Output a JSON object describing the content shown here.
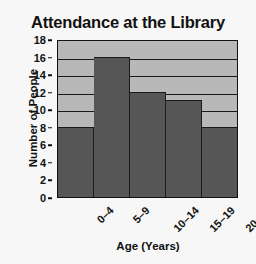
{
  "chart_data": {
    "type": "bar",
    "title": "Attendance at the Library",
    "xlabel": "Age (Years)",
    "ylabel": "Number of People",
    "categories": [
      "0–4",
      "5–9",
      "10–14",
      "15–19",
      "20–24"
    ],
    "values": [
      8,
      16,
      12,
      11,
      8
    ],
    "ylim": [
      0,
      18
    ],
    "ytick_values": [
      0,
      2,
      4,
      6,
      8,
      10,
      12,
      14,
      16,
      18
    ],
    "ytick_labels": [
      "0",
      "2",
      "4",
      "6",
      "8",
      "10",
      "12",
      "14",
      "16",
      "18"
    ],
    "grid": true,
    "legend": null,
    "colors": {
      "bar_fill": "#565656",
      "plot_background": "#b8b8b8",
      "axis": "#111111",
      "page_background": "#f7f7f7",
      "text": "#111111"
    }
  }
}
